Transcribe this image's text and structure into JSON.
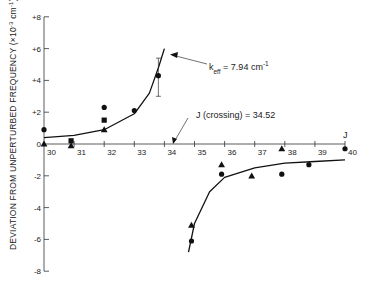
{
  "chart_data": {
    "type": "scatter",
    "title": "",
    "xlabel": "J",
    "ylabel": "DEVIATION FROM UNPERTURBED FREQUENCY (×10⁻³ cm⁻¹)",
    "xlim": [
      30,
      40
    ],
    "ylim": [
      -8,
      8
    ],
    "grid": false,
    "x_ticks": [
      "30",
      "31",
      "32",
      "33",
      "34",
      "35",
      "36",
      "37",
      "38",
      "39",
      "40"
    ],
    "y_ticks": [
      "+8",
      "+6",
      "+4",
      "+2",
      "0",
      "-2",
      "-4",
      "-6",
      "-8"
    ],
    "series": [
      {
        "name": "circles",
        "marker": "circle",
        "points": [
          [
            30,
            0.9
          ],
          [
            32,
            2.3
          ],
          [
            33,
            2.1
          ],
          [
            33.8,
            4.3
          ],
          [
            34.9,
            -6.1
          ],
          [
            35.9,
            -1.9
          ],
          [
            37.9,
            -1.9
          ],
          [
            38.8,
            -1.3
          ],
          [
            40,
            -0.3
          ]
        ]
      },
      {
        "name": "squares",
        "marker": "square",
        "points": [
          [
            30.9,
            0.2
          ],
          [
            32,
            1.5
          ]
        ]
      },
      {
        "name": "triangles",
        "marker": "triangle",
        "points": [
          [
            30,
            0.0
          ],
          [
            30.9,
            -0.1
          ],
          [
            32,
            0.9
          ],
          [
            34.9,
            -5.1
          ],
          [
            35.9,
            -1.3
          ],
          [
            36.9,
            -2.0
          ],
          [
            37.9,
            -0.3
          ]
        ]
      },
      {
        "name": "fit_curve_left",
        "type": "line",
        "points": [
          [
            30,
            0.4
          ],
          [
            31,
            0.55
          ],
          [
            32,
            0.9
          ],
          [
            33,
            1.9
          ],
          [
            33.5,
            3.2
          ],
          [
            33.8,
            4.8
          ],
          [
            34,
            6.0
          ]
        ]
      },
      {
        "name": "fit_curve_right",
        "type": "line",
        "points": [
          [
            34.8,
            -6.8
          ],
          [
            35,
            -5.0
          ],
          [
            35.5,
            -3.0
          ],
          [
            36,
            -2.1
          ],
          [
            37,
            -1.5
          ],
          [
            38,
            -1.2
          ],
          [
            39,
            -1.1
          ],
          [
            40,
            -1.0
          ]
        ]
      }
    ],
    "annotations": [
      {
        "text": "k_eff = 7.94 cm⁻¹",
        "points_to": [
          34,
          5.8
        ]
      },
      {
        "text": "J (crossing) = 34.52",
        "points_to": [
          34.3,
          0
        ]
      }
    ],
    "error_bars": [
      {
        "x": 33.8,
        "y": 4.3,
        "low": 3.0,
        "high": 5.4
      }
    ]
  },
  "labels": {
    "ylabel": "DEVIATION FROM UNPERTURBED FREQUENCY (×10",
    "ylabel_exp": "-3",
    "ylabel_tail": " cm",
    "ylabel_exp2": "-1",
    "ylabel_close": ")",
    "xlabel": "J",
    "keff_k": "k",
    "keff_sub": "eff",
    "keff_val": " = 7.94 cm",
    "keff_sup": "-1",
    "crossing": "J (crossing) = 34.52"
  }
}
